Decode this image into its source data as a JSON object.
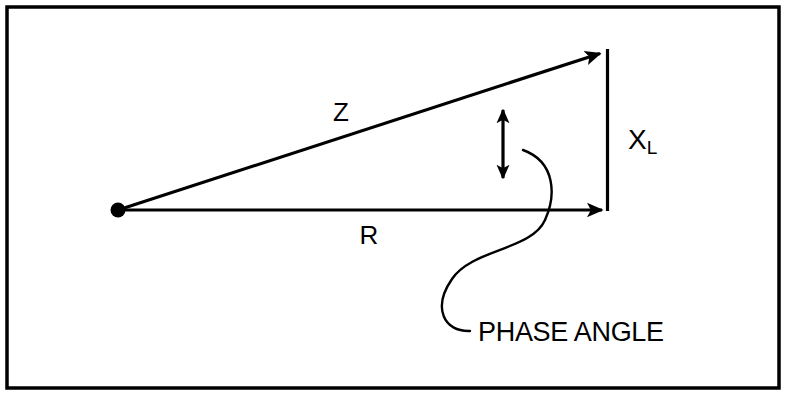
{
  "diagram": {
    "kind": "impedance-triangle-phasor-diagram",
    "background_color": "#ffffff",
    "stroke_color": "#000000",
    "frame": {
      "name": "outer-border",
      "x": 7,
      "y": 7,
      "width": 772,
      "height": 381,
      "stroke_width": 3.5,
      "color": "#000000"
    },
    "origin": {
      "name": "origin-point",
      "x": 118,
      "y": 210,
      "radius": 7.5,
      "color": "#000000"
    },
    "vectors": [
      {
        "id": "z",
        "label": "Z",
        "description": "impedance vector (hypotenuse)",
        "x1": 118,
        "y1": 210,
        "x2": 607,
        "y2": 51,
        "arrowhead": "end",
        "stroke_width": 3.2,
        "label_x": 341,
        "label_y": 121,
        "font_size": 26
      },
      {
        "id": "r",
        "label": "R",
        "description": "resistance vector (horizontal leg)",
        "x1": 118,
        "y1": 210,
        "x2": 609,
        "y2": 210,
        "arrowhead": "end",
        "stroke_width": 3.2,
        "label_x": 369,
        "label_y": 244,
        "font_size": 26
      },
      {
        "id": "xl",
        "label": "X",
        "sublabel": "L",
        "description": "inductive reactance (vertical leg)",
        "x1": 607,
        "y1": 51,
        "x2": 607,
        "y2": 210,
        "arrowhead": "none",
        "stroke_width": 3.2,
        "label_x": 628,
        "label_y": 149,
        "font_size": 28,
        "sub_font_size": 19
      }
    ],
    "angle_marker": {
      "name": "phase-angle-double-arrow",
      "x": 503,
      "y_top": 101,
      "y_bottom": 186,
      "stroke_width": 3.2,
      "arrowhead": "both"
    },
    "leader_line": {
      "name": "phase-angle-leader-curve",
      "stroke_width": 2.4,
      "path": "M 523,150 C 556,162 556,196 545,220 C 532,250 472,249 452,279 C 432,308 444,332 470,331"
    },
    "annotations": [
      {
        "id": "phase-angle",
        "text": "PHASE ANGLE",
        "x": 478,
        "y": 341,
        "font_size": 27
      }
    ]
  }
}
